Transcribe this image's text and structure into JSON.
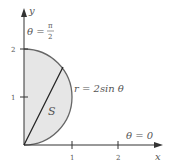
{
  "diagram": {
    "axes": {
      "x_label": "x",
      "y_label": "y",
      "x_ticks": [
        "1",
        "2"
      ],
      "y_ticks": [
        "1",
        "2"
      ]
    },
    "curve": {
      "equation_label": "r = 2sin θ",
      "polar": "r = 2 sin(theta)"
    },
    "region_label": "S",
    "angle_labels": {
      "top": "θ = π/2",
      "top_theta": "θ =",
      "top_num": "π",
      "top_den": "2",
      "right": "θ = 0"
    },
    "colors": {
      "fill": "#e6e6e6",
      "stroke": "#555555",
      "axis": "#333333",
      "text": "#555555"
    }
  }
}
